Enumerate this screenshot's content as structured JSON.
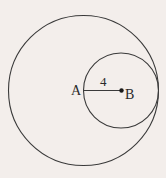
{
  "diagram": {
    "type": "geometry",
    "background": "#f3eeeb",
    "stroke_color": "#3a3a3a",
    "large_circle": {
      "cx": 83.5,
      "cy": 90.5,
      "r": 75
    },
    "small_circle": {
      "cx": 121,
      "cy": 90.5,
      "r": 37.5
    },
    "segment": {
      "x1": 83.5,
      "y1": 90.5,
      "x2": 121.5,
      "y2": 90.5,
      "label": "4"
    },
    "points": [
      {
        "name": "A",
        "x": 83.5,
        "y": 90.5,
        "label": "A",
        "label_x": 71,
        "label_y": 95
      },
      {
        "name": "B",
        "x": 121.5,
        "y": 90.5,
        "label": "B",
        "label_x": 125,
        "label_y": 99
      }
    ],
    "segment_label_pos": {
      "x": 100,
      "y": 86
    }
  }
}
